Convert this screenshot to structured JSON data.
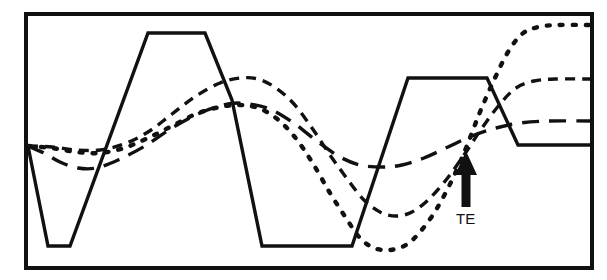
{
  "figure": {
    "background_color": "#ffffff",
    "stroke_color": "#111111",
    "frame": {
      "name": "plot-border",
      "x": 26,
      "y": 14,
      "width": 566,
      "height": 254,
      "stroke_width": 4
    }
  },
  "annotations": [
    {
      "id": "te",
      "label": "TE",
      "label_x": 456,
      "label_y": 224,
      "arrow": {
        "tip_x": 466,
        "tip_y": 151,
        "tail_y": 207,
        "shaft_width": 9,
        "head_width": 22,
        "head_height": 24
      }
    }
  ],
  "chart_data": {
    "type": "line",
    "title": "",
    "xlabel": "",
    "ylabel": "",
    "xlim": [
      26,
      592
    ],
    "ylim": [
      268,
      14
    ],
    "grid": false,
    "legend": "none",
    "axis_ticks": false,
    "series": [
      {
        "name": "solid-trapezoid-wave",
        "style": "solid",
        "dasharray": "",
        "stroke_width": 3.4,
        "points": [
          [
            28,
            146
          ],
          [
            48,
            246
          ],
          [
            70,
            246
          ],
          [
            148,
            33
          ],
          [
            205,
            33
          ],
          [
            232,
            100
          ],
          [
            262,
            246
          ],
          [
            352,
            246
          ],
          [
            408,
            78
          ],
          [
            487,
            78
          ],
          [
            518,
            145
          ],
          [
            590,
            145
          ]
        ]
      },
      {
        "name": "long-dash-wave",
        "style": "long-dash",
        "dasharray": "17 10",
        "stroke_width": 3.4,
        "points": [
          [
            28,
            146
          ],
          [
            44,
            153
          ],
          [
            60,
            162
          ],
          [
            78,
            168
          ],
          [
            96,
            168
          ],
          [
            118,
            160
          ],
          [
            145,
            146
          ],
          [
            172,
            128
          ],
          [
            200,
            113
          ],
          [
            228,
            104
          ],
          [
            250,
            104
          ],
          [
            272,
            110
          ],
          [
            295,
            124
          ],
          [
            318,
            142
          ],
          [
            340,
            157
          ],
          [
            360,
            165
          ],
          [
            382,
            167
          ],
          [
            402,
            165
          ],
          [
            424,
            158
          ],
          [
            448,
            147
          ],
          [
            472,
            136
          ],
          [
            496,
            128
          ],
          [
            520,
            123
          ],
          [
            548,
            121
          ],
          [
            590,
            121
          ]
        ]
      },
      {
        "name": "short-dash-wave",
        "style": "short-dash",
        "dasharray": "10 7",
        "stroke_width": 3.4,
        "points": [
          [
            28,
            146
          ],
          [
            52,
            147
          ],
          [
            76,
            150
          ],
          [
            100,
            150
          ],
          [
            124,
            144
          ],
          [
            148,
            132
          ],
          [
            172,
            114
          ],
          [
            196,
            96
          ],
          [
            220,
            83
          ],
          [
            240,
            78
          ],
          [
            258,
            79
          ],
          [
            276,
            88
          ],
          [
            294,
            104
          ],
          [
            312,
            128
          ],
          [
            330,
            155
          ],
          [
            348,
            180
          ],
          [
            364,
            200
          ],
          [
            380,
            212
          ],
          [
            396,
            216
          ],
          [
            412,
            212
          ],
          [
            428,
            200
          ],
          [
            446,
            180
          ],
          [
            464,
            155
          ],
          [
            482,
            128
          ],
          [
            500,
            104
          ],
          [
            516,
            88
          ],
          [
            534,
            81
          ],
          [
            556,
            79
          ],
          [
            590,
            79
          ]
        ]
      },
      {
        "name": "dotted-wave",
        "style": "dotted",
        "dasharray": "3 10",
        "stroke_width": 4.4,
        "points": [
          [
            28,
            146
          ],
          [
            52,
            148
          ],
          [
            76,
            152
          ],
          [
            100,
            153
          ],
          [
            124,
            148
          ],
          [
            148,
            138
          ],
          [
            172,
            126
          ],
          [
            196,
            114
          ],
          [
            220,
            107
          ],
          [
            240,
            105
          ],
          [
            258,
            108
          ],
          [
            276,
            118
          ],
          [
            294,
            136
          ],
          [
            312,
            162
          ],
          [
            330,
            193
          ],
          [
            346,
            218
          ],
          [
            360,
            238
          ],
          [
            374,
            248
          ],
          [
            390,
            250
          ],
          [
            406,
            245
          ],
          [
            420,
            232
          ],
          [
            436,
            210
          ],
          [
            452,
            180
          ],
          [
            466,
            148
          ],
          [
            480,
            112
          ],
          [
            494,
            80
          ],
          [
            508,
            52
          ],
          [
            522,
            34
          ],
          [
            538,
            27
          ],
          [
            558,
            25
          ],
          [
            590,
            25
          ]
        ]
      }
    ]
  }
}
